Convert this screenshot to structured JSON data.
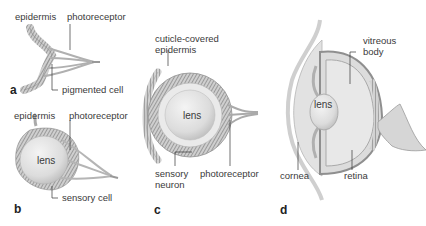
{
  "figure": {
    "panels": [
      {
        "id": "a",
        "letter": "a",
        "labels": {
          "epidermis": "epidermis",
          "photoreceptor": "photoreceptor",
          "pigmented_cell": "pigmented cell"
        }
      },
      {
        "id": "b",
        "letter": "b",
        "labels": {
          "epidermis": "epidermis",
          "photoreceptor": "photoreceptor",
          "lens": "lens",
          "sensory_cell": "sensory cell"
        }
      },
      {
        "id": "c",
        "letter": "c",
        "labels": {
          "cuticle_line1": "cuticle-covered",
          "cuticle_line2": "epidermis",
          "lens": "lens",
          "sensory_line1": "sensory",
          "sensory_line2": "neuron",
          "photoreceptor": "photoreceptor"
        }
      },
      {
        "id": "d",
        "letter": "d",
        "labels": {
          "vitreous_line1": "vitreous",
          "vitreous_line2": "body",
          "lens": "lens",
          "cornea": "cornea",
          "retina": "retina"
        }
      }
    ],
    "colors": {
      "background": "#ffffff",
      "tissue": "#c8c8c8",
      "tissue_dark": "#8a8a8a",
      "lens": "#e6e6e6",
      "leader": "#333333"
    }
  }
}
